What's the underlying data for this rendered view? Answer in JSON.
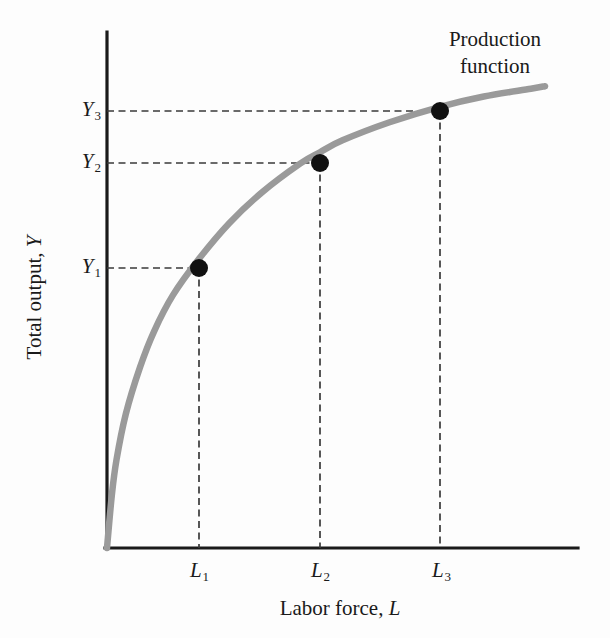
{
  "figure": {
    "background_color": "#fdfdfd",
    "curve_color": "#9a9a9a",
    "axis_color": "#1a1a1a",
    "point_color": "#111111",
    "dash_color": "#3a3a3a"
  },
  "annotation": {
    "line1": "Production",
    "line2": "function"
  },
  "axes": {
    "y_title_text": "Total output, ",
    "y_title_symbol": "Y",
    "x_title_text": "Labor force, ",
    "x_title_symbol": "L"
  },
  "y_ticks": [
    {
      "symbol": "Y",
      "sub": "3"
    },
    {
      "symbol": "Y",
      "sub": "2"
    },
    {
      "symbol": "Y",
      "sub": "1"
    }
  ],
  "x_ticks": [
    {
      "symbol": "L",
      "sub": "1"
    },
    {
      "symbol": "L",
      "sub": "2"
    },
    {
      "symbol": "L",
      "sub": "3"
    }
  ],
  "chart_data": {
    "type": "line",
    "title": "Production function",
    "xlabel": "Labor force, L",
    "ylabel": "Total output, Y",
    "grid": false,
    "legend": "none",
    "annotations": [
      "Production function"
    ],
    "axis_pixel_frame": {
      "x0": 107,
      "y0": 548,
      "x_end": 578,
      "y_top": 32
    },
    "xlim": [
      0,
      1
    ],
    "ylim": [
      0,
      1
    ],
    "curve_description": "Concave increasing production function Y = F(L) with diminishing marginal product of labor; passes through origin, steep at low L, flattening as L rises",
    "curve_points": [
      {
        "x": 0.0,
        "y": 0.0
      },
      {
        "x": 0.01,
        "y": 0.1
      },
      {
        "x": 0.02,
        "y": 0.17
      },
      {
        "x": 0.04,
        "y": 0.26
      },
      {
        "x": 0.07,
        "y": 0.35
      },
      {
        "x": 0.1,
        "y": 0.42
      },
      {
        "x": 0.14,
        "y": 0.49
      },
      {
        "x": 0.195,
        "y": 0.56
      },
      {
        "x": 0.26,
        "y": 0.63
      },
      {
        "x": 0.33,
        "y": 0.69
      },
      {
        "x": 0.41,
        "y": 0.745
      },
      {
        "x": 0.452,
        "y": 0.767
      },
      {
        "x": 0.5,
        "y": 0.79
      },
      {
        "x": 0.6,
        "y": 0.825
      },
      {
        "x": 0.707,
        "y": 0.855
      },
      {
        "x": 0.8,
        "y": 0.875
      },
      {
        "x": 0.9,
        "y": 0.89
      },
      {
        "x": 0.93,
        "y": 0.895
      }
    ],
    "marked_points": [
      {
        "label": "1",
        "x_label": "L1",
        "y_label": "Y1",
        "x": 0.195,
        "y": 0.56
      },
      {
        "label": "2",
        "x_label": "L2",
        "y_label": "Y2",
        "x": 0.452,
        "y": 0.767
      },
      {
        "label": "3",
        "x_label": "L3",
        "y_label": "Y3",
        "x": 0.707,
        "y": 0.855
      }
    ],
    "tick_positions": {
      "x": [
        {
          "label": "L1",
          "pixel": 199
        },
        {
          "label": "L2",
          "pixel": 320
        },
        {
          "label": "L3",
          "pixel": 440
        }
      ],
      "y": [
        {
          "label": "Y3",
          "pixel": 111
        },
        {
          "label": "Y2",
          "pixel": 163
        },
        {
          "label": "Y1",
          "pixel": 268
        }
      ]
    }
  }
}
